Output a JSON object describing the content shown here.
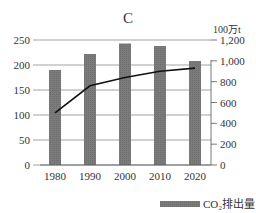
{
  "chart_data": {
    "type": "bar",
    "title": "C",
    "categories": [
      "1980",
      "1990",
      "2000",
      "2010",
      "2020"
    ],
    "series": [
      {
        "name": "CO₂排出量",
        "type": "bar",
        "axis": "left",
        "values": [
          190,
          222,
          243,
          238,
          208
        ],
        "color": "#7b7b7b"
      },
      {
        "name": "",
        "type": "line",
        "axis": "right",
        "values": [
          500,
          760,
          840,
          900,
          930
        ],
        "color": "#111111"
      }
    ],
    "left_axis": {
      "label": "",
      "ylim": [
        0,
        250
      ],
      "ticks": [
        0,
        50,
        100,
        150,
        200,
        250
      ],
      "tick_labels": [
        "0",
        "50",
        "100",
        "150",
        "200",
        "250"
      ]
    },
    "right_axis": {
      "label": "100万t",
      "ylim": [
        0,
        1200
      ],
      "ticks": [
        0,
        200,
        400,
        600,
        800,
        1000,
        1200
      ],
      "tick_labels": [
        "0",
        "200",
        "400",
        "600",
        "800",
        "1,000",
        "1,200"
      ]
    },
    "xlabel": "",
    "grid": true,
    "legend": {
      "position": "bottom-right",
      "entries": [
        "CO₂排出量"
      ]
    }
  }
}
